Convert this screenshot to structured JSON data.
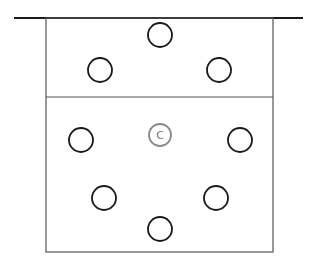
{
  "diagram": {
    "width": 314,
    "height": 263,
    "colors": {
      "line": "#1a1a1a",
      "box": "#555555",
      "center_circle": "#8a8a8a"
    },
    "top_line": {
      "x1": 14,
      "x2": 303,
      "y": 18
    },
    "box": {
      "x": 46,
      "y": 18,
      "width": 227,
      "height": 234,
      "divider_y": 97
    },
    "circles": [
      {
        "id": "top",
        "cx": 160,
        "cy": 35,
        "r": 12
      },
      {
        "id": "upper-left",
        "cx": 100,
        "cy": 70,
        "r": 12
      },
      {
        "id": "upper-right",
        "cx": 219,
        "cy": 70,
        "r": 12
      },
      {
        "id": "mid-left",
        "cx": 81,
        "cy": 140,
        "r": 12
      },
      {
        "id": "mid-right",
        "cx": 240,
        "cy": 140,
        "r": 12
      },
      {
        "id": "lower-left",
        "cx": 104,
        "cy": 198,
        "r": 12
      },
      {
        "id": "lower-right",
        "cx": 216,
        "cy": 198,
        "r": 12
      },
      {
        "id": "bottom",
        "cx": 160,
        "cy": 229,
        "r": 12
      }
    ],
    "center_marker": {
      "cx": 160,
      "cy": 135,
      "r": 11,
      "label": "C"
    }
  }
}
